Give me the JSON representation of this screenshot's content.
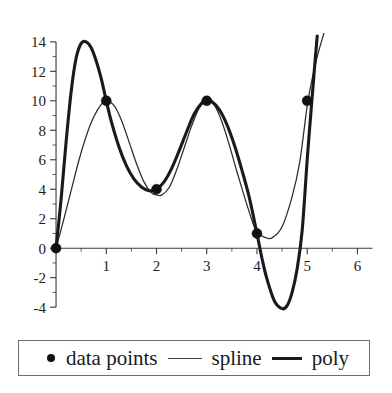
{
  "chart_data": {
    "type": "line",
    "title": "",
    "xlabel": "",
    "ylabel": "",
    "xlim": [
      -0.18,
      6.35
    ],
    "ylim": [
      -4.6,
      14.6
    ],
    "grid": false,
    "legend_position": "bottom",
    "x_ticks": [
      1,
      2,
      3,
      4,
      5,
      6
    ],
    "x_tick_labels": [
      "1",
      "2",
      "3",
      "4",
      "5",
      "6"
    ],
    "x_minor_ticks": [
      0.5,
      1.5,
      2.5,
      3.5,
      4.5,
      5.5
    ],
    "y_ticks": [
      -4,
      -2,
      0,
      2,
      4,
      6,
      8,
      10,
      12,
      14
    ],
    "y_tick_labels": [
      "-4",
      "-2",
      "0",
      "2",
      "4",
      "6",
      "8",
      "10",
      "12",
      "14"
    ],
    "y_minor_ticks": [
      -3,
      -1,
      1,
      3,
      5,
      7,
      9,
      11,
      13
    ],
    "data_points": {
      "x": [
        0,
        1,
        2,
        3,
        4,
        5
      ],
      "y": [
        0,
        10,
        4,
        10,
        1,
        10
      ]
    },
    "series": [
      {
        "name": "data points",
        "type": "scatter",
        "marker": "filled-circle",
        "color": "#111111",
        "x": [
          0,
          1,
          2,
          3,
          4,
          5
        ],
        "y": [
          0,
          10,
          4,
          10,
          1,
          10
        ]
      },
      {
        "name": "spline",
        "type": "line",
        "style": "thin",
        "color": "#2b2b2b",
        "x": [
          0,
          0.15,
          0.3,
          0.45,
          0.6,
          0.75,
          0.9,
          1,
          1.15,
          1.3,
          1.45,
          1.6,
          1.75,
          1.9,
          2,
          2.1,
          2.25,
          2.4,
          2.55,
          2.7,
          2.85,
          3,
          3.15,
          3.3,
          3.45,
          3.6,
          3.75,
          3.9,
          4,
          4.15,
          4.3,
          4.5,
          4.7,
          4.85,
          5,
          5.1,
          5.2,
          5.3,
          5.4
        ],
        "y": [
          0,
          1.9,
          3.9,
          5.9,
          7.6,
          8.9,
          9.75,
          10,
          9.7,
          8.7,
          7.25,
          5.75,
          4.5,
          3.75,
          3.62,
          3.6,
          4.1,
          5.3,
          6.8,
          8.3,
          9.5,
          10,
          9.7,
          8.6,
          7.0,
          5.2,
          3.5,
          1.9,
          1.05,
          0.75,
          0.7,
          1.45,
          3.5,
          5.8,
          9.65,
          11.5,
          13.0,
          14.2,
          15.3
        ]
      },
      {
        "name": "poly",
        "type": "line",
        "style": "thick",
        "color": "#1a1a1a",
        "x": [
          0,
          0.1,
          0.2,
          0.3,
          0.4,
          0.5,
          0.6,
          0.7,
          0.8,
          0.9,
          1,
          1.1,
          1.25,
          1.4,
          1.55,
          1.7,
          1.85,
          2,
          2.15,
          2.3,
          2.45,
          2.6,
          2.75,
          2.9,
          3,
          3.1,
          3.25,
          3.4,
          3.55,
          3.7,
          3.85,
          4,
          4.1,
          4.2,
          4.35,
          4.5,
          4.6,
          4.7,
          4.8,
          4.9,
          5,
          5.05,
          5.1,
          5.15,
          5.2
        ],
        "y": [
          0,
          3.3,
          7.2,
          10.6,
          12.9,
          13.9,
          14.0,
          13.6,
          12.7,
          11.5,
          10.0,
          8.6,
          6.9,
          5.6,
          4.7,
          4.15,
          3.9,
          4.0,
          4.5,
          5.4,
          6.6,
          7.9,
          9.1,
          9.85,
          10.0,
          9.95,
          9.4,
          8.4,
          7.0,
          5.3,
          3.4,
          1.0,
          -0.7,
          -2.1,
          -3.6,
          -4.1,
          -3.9,
          -3.0,
          -1.4,
          1.2,
          6.0,
          8.2,
          10.3,
          12.4,
          14.4
        ]
      }
    ]
  },
  "legend": {
    "entries": [
      {
        "label": "data points",
        "marker": "filled-circle"
      },
      {
        "label": "spline",
        "marker": "thin-line"
      },
      {
        "label": "poly",
        "marker": "thick-line"
      }
    ]
  },
  "colors": {
    "axis": "#3a3a3a",
    "spline": "#2b2b2b",
    "poly": "#1a1a1a",
    "marker": "#111111",
    "legend_border": "#6d6d6d",
    "background": "#ffffff"
  }
}
